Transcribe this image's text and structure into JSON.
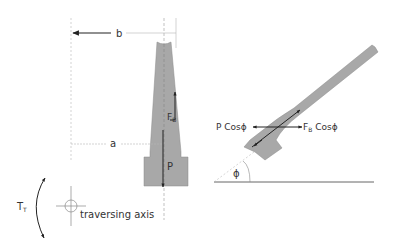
{
  "colors": {
    "body_fill": "#a8a8a8",
    "body_stroke": "#7a7a7a",
    "arrow": "#222222",
    "guide": "#aaaaaa",
    "text": "#333333"
  },
  "left_view": {
    "dimension_b": "b",
    "dimension_a": "a",
    "force_fb_main": "F",
    "force_fb_sub": "B",
    "force_p": "P"
  },
  "axis": {
    "torque_main": "T",
    "torque_sub": "T",
    "traversing_axis_label": "traversing axis"
  },
  "right_view": {
    "p_cos_label": "P Cosϕ",
    "fb_cos_main": "F",
    "fb_cos_sub": "B",
    "fb_cos_rest": " Cosϕ",
    "angle_label": "ϕ"
  }
}
